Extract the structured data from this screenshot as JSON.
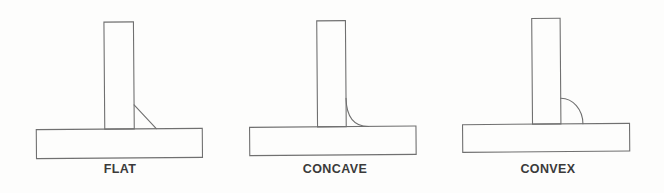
{
  "page": {
    "background": "#fdfdfc"
  },
  "colors": {
    "line": "#707070",
    "label": "#3a3a3a"
  },
  "figures": [
    {
      "id": "flat",
      "label": "FLAT",
      "weld_profile": "flat straight bead on tee joint"
    },
    {
      "id": "concave",
      "label": "CONCAVE",
      "weld_profile": "concave inward-curved bead on tee joint"
    },
    {
      "id": "convex",
      "label": "CONVEX",
      "weld_profile": "convex outward-bulged bead on tee joint"
    }
  ]
}
